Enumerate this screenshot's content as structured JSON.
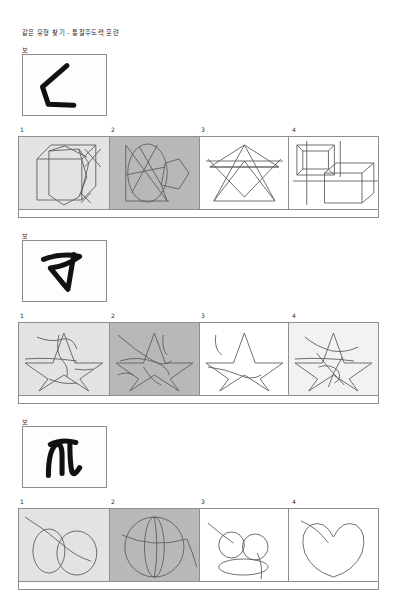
{
  "document": {
    "title": "같은 유형 찾기 - 통찰주도력 훈련",
    "example_label": "보기",
    "choice_numbers": [
      "1",
      "2",
      "3",
      "4"
    ]
  },
  "colors": {
    "page_background": "#ffffff",
    "cell_light_gray": "#e3e3e3",
    "cell_dark_gray": "#b8b8b8",
    "cell_white": "#ffffff",
    "cell_faint_gray": "#f2f2f2",
    "border": "#8e8e8e",
    "line_stroke": "#5e5e5e",
    "glyph_stroke": "#111111",
    "text": "#2b2b2b"
  },
  "sections": [
    {
      "id": "section-1",
      "label": "보기",
      "prompt_figure": "angular-bracket-glyph",
      "choices": [
        {
          "number": "1",
          "background": "#e3e3e3",
          "figure": "cube-wireframe"
        },
        {
          "number": "2",
          "background": "#b8b8b8",
          "figure": "ellipse-polygon-overlay"
        },
        {
          "number": "3",
          "background": "#ffffff",
          "figure": "triangle-lattice"
        },
        {
          "number": "4",
          "background": "#ffffff",
          "figure": "nested-boxes"
        }
      ]
    },
    {
      "id": "section-2",
      "label": "보기",
      "prompt_figure": "z-arrow-glyph",
      "choices": [
        {
          "number": "1",
          "background": "#e3e3e3",
          "figure": "star-with-scribbles-a"
        },
        {
          "number": "2",
          "background": "#b8b8b8",
          "figure": "star-with-scribbles-b"
        },
        {
          "number": "3",
          "background": "#ffffff",
          "figure": "star-plain"
        },
        {
          "number": "4",
          "background": "#f2f2f2",
          "figure": "star-with-scribbles-c"
        }
      ]
    },
    {
      "id": "section-3",
      "label": "보기",
      "prompt_figure": "m-curve-glyph",
      "choices": [
        {
          "number": "1",
          "background": "#e3e3e3",
          "figure": "two-ellipses-crossed"
        },
        {
          "number": "2",
          "background": "#b8b8b8",
          "figure": "sphere-meridians"
        },
        {
          "number": "3",
          "background": "#ffffff",
          "figure": "circles-on-ellipse"
        },
        {
          "number": "4",
          "background": "#ffffff",
          "figure": "heart-outline"
        }
      ]
    }
  ]
}
